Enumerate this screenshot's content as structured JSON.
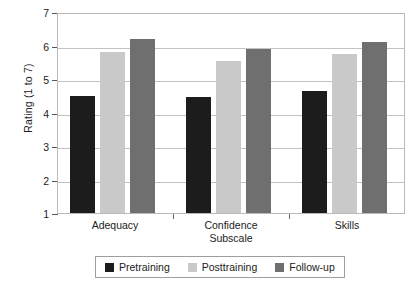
{
  "chart_data": {
    "type": "bar",
    "title": "",
    "xlabel": "",
    "ylabel": "Rating (1 to 7)",
    "ylim": [
      1,
      7
    ],
    "yticks": [
      1,
      2,
      3,
      4,
      5,
      6,
      7
    ],
    "grid": true,
    "legend_position": "bottom",
    "categories": [
      "Adequacy",
      "Confidence\nSubscale",
      "Skills"
    ],
    "series": [
      {
        "name": "Pretraining",
        "color": "#1c1c1c",
        "values": [
          4.5,
          4.45,
          4.65
        ]
      },
      {
        "name": "Posttraining",
        "color": "#c9c9c9",
        "values": [
          5.8,
          5.55,
          5.75
        ]
      },
      {
        "name": "Follow-up",
        "color": "#6f6f6f",
        "values": [
          6.2,
          5.9,
          6.1
        ]
      }
    ]
  },
  "legend": {
    "items": [
      {
        "label": "Pretraining",
        "color": "#1c1c1c"
      },
      {
        "label": "Posttraining",
        "color": "#c9c9c9"
      },
      {
        "label": "Follow-up",
        "color": "#6f6f6f"
      }
    ]
  }
}
